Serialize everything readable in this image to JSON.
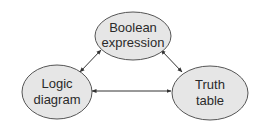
{
  "diagram": {
    "type": "triangle-relationship",
    "colors": {
      "node_fill": "#e6e6e6",
      "node_stroke": "#555555",
      "arrow": "#333333",
      "text": "#2a2a2a"
    },
    "nodes": [
      {
        "id": "boolean-expression",
        "line1": "Boolean",
        "line2": "expression"
      },
      {
        "id": "logic-diagram",
        "line1": "Logic",
        "line2": "diagram"
      },
      {
        "id": "truth-table",
        "line1": "Truth",
        "line2": "table"
      }
    ],
    "edges": [
      {
        "from": "boolean-expression",
        "to": "logic-diagram",
        "bidirectional": true
      },
      {
        "from": "boolean-expression",
        "to": "truth-table",
        "bidirectional": true
      },
      {
        "from": "logic-diagram",
        "to": "truth-table",
        "bidirectional": true
      }
    ]
  }
}
